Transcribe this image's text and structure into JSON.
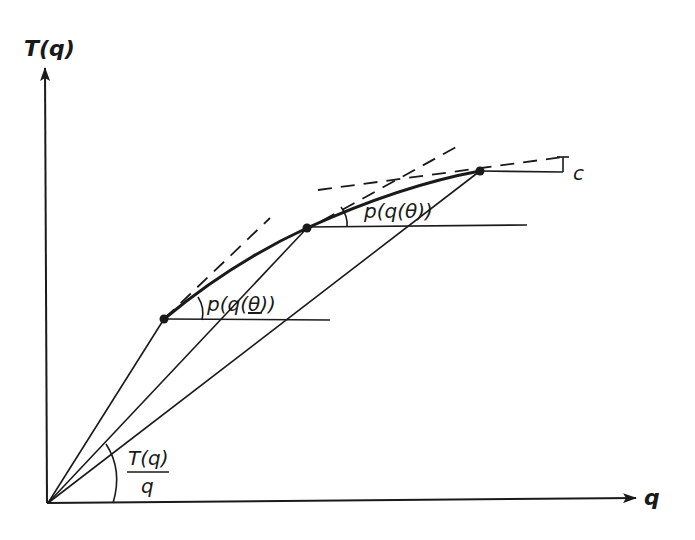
{
  "diagram": {
    "title": "",
    "colors": {
      "ink": "#1a1a1a",
      "background": "#ffffff"
    },
    "axes": {
      "y_label": "T(q)",
      "x_label": "q",
      "origin": [
        48,
        503
      ],
      "y_arrow_tip": [
        45,
        66
      ],
      "x_arrow_tip": [
        638,
        498
      ]
    },
    "curve": {
      "description": "Concave curve T(q) through three marked points",
      "points": [
        {
          "id": "p1",
          "xy": [
            164,
            319
          ]
        },
        {
          "id": "p2",
          "xy": [
            307,
            228
          ]
        },
        {
          "id": "p3",
          "xy": [
            480,
            171
          ]
        }
      ]
    },
    "rays_from_origin": [
      {
        "to": [
          164,
          319
        ]
      },
      {
        "to": [
          307,
          228
        ]
      },
      {
        "to": [
          480,
          171
        ]
      }
    ],
    "labels": {
      "slope_low": {
        "text_pre": "p(q(",
        "theta": "θ",
        "text_post": "))",
        "underlined_theta": true
      },
      "slope_high": {
        "text": "p(q(θ))"
      },
      "average": {
        "numerator": "T(q)",
        "denominator": "q"
      },
      "c_label": "c"
    }
  }
}
